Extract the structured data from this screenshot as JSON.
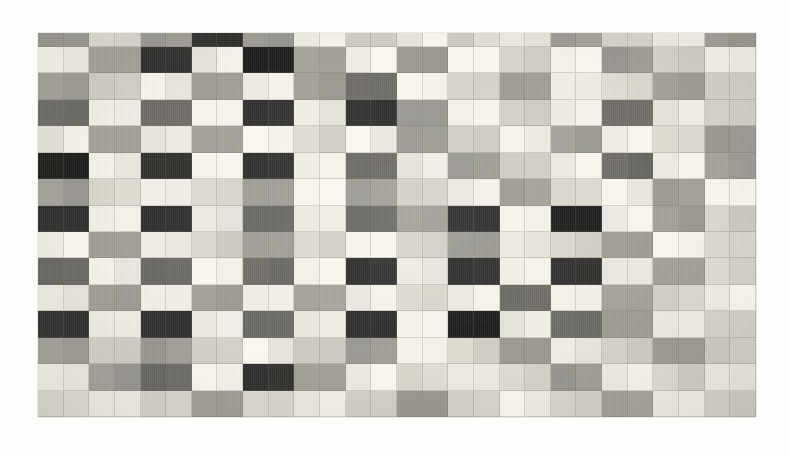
{
  "artwork": {
    "title": "Composition with Grid",
    "medium": "painting",
    "background_color": "#fdfdfb",
    "canvas": {
      "left": 38,
      "top": 33,
      "width": 718,
      "height": 384,
      "columns": 28,
      "rows": 15,
      "first_row_height": 14,
      "cell_width": 25.6,
      "cell_height": 26.4
    },
    "palette": {
      "W": "#f2f0e8",
      "L": "#d8d5cb",
      "M": "#9e9c95",
      "D": "#6a6862",
      "K": "#2e2d2b",
      "B": "#1a1a18"
    },
    "palette_names": {
      "W": "white",
      "L": "light-gray",
      "M": "mid-gray",
      "D": "dark-gray",
      "K": "charcoal",
      "B": "black"
    },
    "grid": [
      "MMLLMMKKMMWWLLWWLLWWMMLLWWMM",
      "WWMMKKWWBBMMWWMMWWLLWWMMLLWW",
      "MMLLWWMMWWMMDDWWLLMMWWLLMMLL",
      "DDWWDDWWKKWWKKMMWWLLWWDDWWLL",
      "WWMMWWMMWWLLWWMMLLWWMMWWLLMM",
      "BBWWKKWWKKWWDDWWMMLLWWDDWWMM",
      "MMLLWWLLMMWWMMLLWWMMLLWWMMWW",
      "KKWWKKWWDDWWDDMMKKWWBBWWMMLL",
      "WWMMWWLLMMLLWWLLMMWWLLMMWWLL",
      "DDWWDDWWDDWWKKWWKKWWKKWWMMLL",
      "WWMMWWMMWWMMWWLLWWDDWWMMLLWW",
      "KKWWKKWWDDWWKKWWBBWWDDMMWWLL",
      "MMLLMMLLWWLLMMWWLLMMWWLLMMLL",
      "WWMMDDWWKKMMWWLLWWLLMMWWLLWW",
      "LLWWLLMMLLWWLLMMLLWWLLMMWWLL"
    ]
  }
}
